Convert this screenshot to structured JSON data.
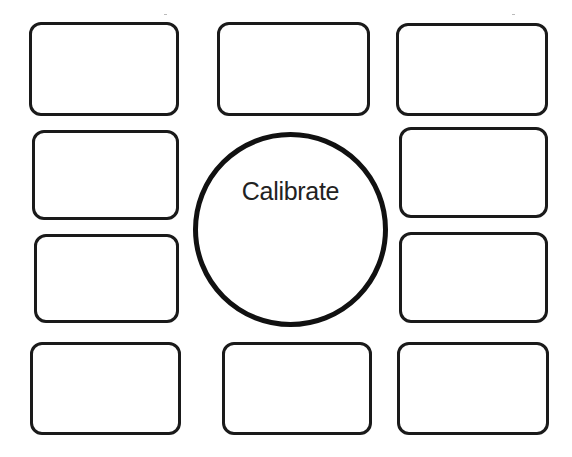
{
  "calibrate": {
    "label": "Calibrate"
  },
  "colors": {
    "stroke": "#1a1a1a",
    "background": "#ffffff",
    "text": "#222222"
  },
  "targets": [
    {
      "id": "top-left",
      "x": 29,
      "y": 22,
      "w": 150,
      "h": 94
    },
    {
      "id": "top-center",
      "x": 217,
      "y": 22,
      "w": 153,
      "h": 94
    },
    {
      "id": "top-right",
      "x": 396,
      "y": 23,
      "w": 152,
      "h": 93
    },
    {
      "id": "row2-left",
      "x": 32,
      "y": 130,
      "w": 147,
      "h": 90
    },
    {
      "id": "row2-right",
      "x": 399,
      "y": 127,
      "w": 149,
      "h": 91
    },
    {
      "id": "row3-left",
      "x": 34,
      "y": 234,
      "w": 145,
      "h": 89
    },
    {
      "id": "row3-right",
      "x": 399,
      "y": 232,
      "w": 149,
      "h": 91
    },
    {
      "id": "bottom-left",
      "x": 30,
      "y": 342,
      "w": 151,
      "h": 93
    },
    {
      "id": "bottom-center",
      "x": 222,
      "y": 342,
      "w": 150,
      "h": 93
    },
    {
      "id": "bottom-right",
      "x": 397,
      "y": 342,
      "w": 152,
      "h": 93
    }
  ]
}
